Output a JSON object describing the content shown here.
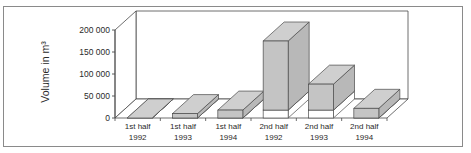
{
  "chart_data": {
    "type": "bar",
    "style": "3d",
    "title": "",
    "xlabel": "",
    "ylabel": "Volume in m³",
    "ylim": [
      0,
      200000
    ],
    "yticks": [
      0,
      50000,
      100000,
      150000,
      200000
    ],
    "ytick_labels": [
      "0",
      "50 000",
      "100 000",
      "150 000",
      "200 000"
    ],
    "grid": false,
    "legend": "none",
    "categories": [
      [
        "1st half",
        "1992"
      ],
      [
        "1st half",
        "1993"
      ],
      [
        "1st half",
        "1994"
      ],
      [
        "2nd half",
        "1992"
      ],
      [
        "2nd half",
        "1993"
      ],
      [
        "2nd half",
        "1994"
      ]
    ],
    "series": [
      {
        "name": "base (white)",
        "color": "#ffffff",
        "values": [
          0,
          0,
          0,
          18000,
          18000,
          0
        ]
      },
      {
        "name": "volume (gray)",
        "color": "#c4c4c4",
        "values": [
          0,
          10000,
          18000,
          157000,
          59000,
          22000
        ]
      }
    ],
    "totals": [
      0,
      10000,
      18000,
      175000,
      77000,
      22000
    ]
  }
}
